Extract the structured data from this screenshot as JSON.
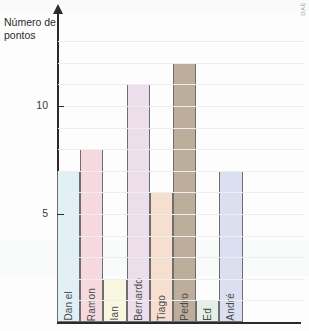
{
  "watermark": "DAE",
  "axis_title": "Número de pontos",
  "chart_data": {
    "type": "bar",
    "title": "",
    "xlabel": "",
    "ylabel": "Número de pontos",
    "categories": [
      "Daniel",
      "Ramon",
      "Ian",
      "Bernardo",
      "Tiago",
      "Pedro",
      "Ed",
      "André"
    ],
    "values": [
      7,
      8,
      2,
      11,
      6,
      12,
      1,
      7
    ],
    "ylim": [
      0,
      13
    ],
    "yticks": [
      5,
      10
    ],
    "ytick_labels": [
      "5",
      "10"
    ],
    "grid": true,
    "legend": "none",
    "colors": [
      "#e1f0f5",
      "#f6d9de",
      "#f9f7df",
      "#ecdeea",
      "#f7dfcf",
      "#bcae9a",
      "#e4f0e6",
      "#dcdff0"
    ]
  }
}
